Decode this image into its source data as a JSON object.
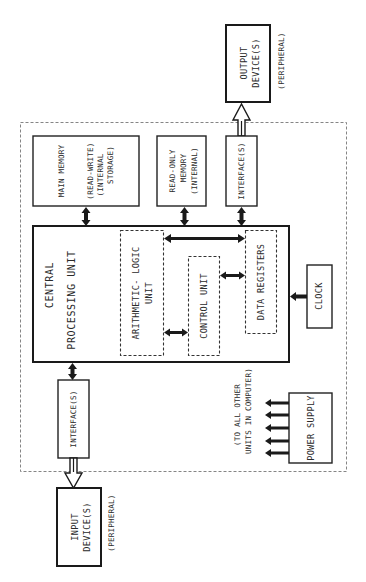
{
  "diagram": {
    "type": "block-diagram",
    "orientation": "rotated-90-ccw",
    "boundary": {
      "style": "dashed",
      "label": ""
    },
    "nodes": {
      "main_memory": {
        "line1": "MAIN MEMORY",
        "line2": "(READ-WRITE)",
        "line3": "(INTERNAL",
        "line4": "STORAGE)"
      },
      "rom": {
        "line1": "READ-ONLY",
        "line2": "MEMORY",
        "line3": "(INTERNAL)"
      },
      "output_interface": {
        "label": "INTERFACE(S)"
      },
      "output_device": {
        "line1": "OUTPUT",
        "line2": "DEVICE(S)",
        "note": "(PERIPHERAL)"
      },
      "cpu": {
        "line1": "CENTRAL",
        "line2": "PROCESSING UNIT"
      },
      "alu": {
        "line1": "ARITHMETIC- LOGIC",
        "line2": "UNIT"
      },
      "control_unit": {
        "label": "CONTROL UNIT"
      },
      "data_registers": {
        "label": "DATA REGISTERS"
      },
      "clock": {
        "label": "CLOCK"
      },
      "input_interface": {
        "label": "INTERFACE(S)"
      },
      "input_device": {
        "line1": "INPUT",
        "line2": "DEVICE(S)",
        "note": "(PERIPHERAL)"
      },
      "power_supply": {
        "label": "POWER SUPPLY",
        "note1": "(TO ALL OTHER",
        "note2": "UNITS IN COMPUTER)"
      }
    },
    "edges": [
      {
        "from": "main_memory",
        "to": "cpu",
        "type": "bidirectional"
      },
      {
        "from": "rom",
        "to": "cpu",
        "type": "bidirectional"
      },
      {
        "from": "output_interface",
        "to": "cpu",
        "type": "bidirectional"
      },
      {
        "from": "output_interface",
        "to": "output_device",
        "type": "hollow-bus"
      },
      {
        "from": "alu",
        "to": "data_registers",
        "type": "bidirectional"
      },
      {
        "from": "control_unit",
        "to": "data_registers",
        "type": "bidirectional"
      },
      {
        "from": "alu",
        "to": "control_unit",
        "type": "bidirectional"
      },
      {
        "from": "clock",
        "to": "cpu",
        "type": "directed"
      },
      {
        "from": "cpu",
        "to": "input_interface",
        "type": "bidirectional"
      },
      {
        "from": "input_device",
        "to": "input_interface",
        "type": "hollow-bus"
      },
      {
        "from": "power_supply",
        "to": "all_units",
        "type": "directed",
        "count": 5
      }
    ]
  }
}
